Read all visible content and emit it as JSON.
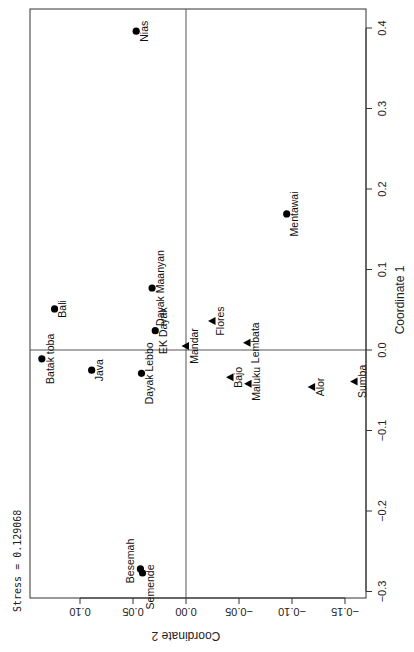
{
  "chart_data": {
    "type": "scatter",
    "title": "",
    "annotation": "Stress = 0.129068",
    "xlabel": "Coordinate 1",
    "ylabel": "Coordinate 2",
    "xlim": [
      -0.3,
      0.42
    ],
    "ylim": [
      -0.16,
      0.14
    ],
    "x_ticks": [
      "-0.3",
      "-0.2",
      "-0.1",
      "0.0",
      "0.1",
      "0.2",
      "0.3",
      "0.4"
    ],
    "y_ticks": [
      "-0.15",
      "-0.10",
      "-0.05",
      "0.00",
      "0.05",
      "0.10"
    ],
    "grid": false,
    "reference_lines": {
      "x": 0.0,
      "y": 0.0
    },
    "orientation_note": "figure rotated 90 degrees counter-clockwise on page",
    "legend": [],
    "series": [
      {
        "name": "circle",
        "marker": "circle",
        "points": [
          {
            "label": "Nias",
            "x": 0.396,
            "y": 0.047
          },
          {
            "label": "Bali",
            "x": 0.051,
            "y": 0.124
          },
          {
            "label": "Dayak Maanyan",
            "x": 0.077,
            "y": 0.032
          },
          {
            "label": "EK Dayak",
            "x": 0.024,
            "y": 0.029
          },
          {
            "label": "Batak toba",
            "x": -0.011,
            "y": 0.136
          },
          {
            "label": "Java",
            "x": -0.025,
            "y": 0.089
          },
          {
            "label": "Dayak Lebbo",
            "x": -0.029,
            "y": 0.042
          },
          {
            "label": "Besemah",
            "x": -0.272,
            "y": 0.043
          },
          {
            "label": "Semende",
            "x": -0.277,
            "y": 0.041
          },
          {
            "label": "Mentawai",
            "x": 0.169,
            "y": -0.095
          }
        ]
      },
      {
        "name": "triangle",
        "marker": "triangle",
        "points": [
          {
            "label": "Mandar",
            "x": 0.005,
            "y": 0.0
          },
          {
            "label": "Flores",
            "x": 0.036,
            "y": -0.025
          },
          {
            "label": "Lembata",
            "x": 0.009,
            "y": -0.058
          },
          {
            "label": "Bajo",
            "x": -0.034,
            "y": -0.042
          },
          {
            "label": "Maluku",
            "x": -0.042,
            "y": -0.059
          },
          {
            "label": "Alor",
            "x": -0.046,
            "y": -0.119
          },
          {
            "label": "Sumba",
            "x": -0.039,
            "y": -0.159
          }
        ]
      }
    ]
  },
  "labels": {
    "stress": "Stress = 0.129068",
    "coord1": "Coordinate 1",
    "coord2": "Coordinate 2"
  },
  "colors": {
    "marker": "#000000",
    "axis": "#333333",
    "refline": "#555555"
  }
}
